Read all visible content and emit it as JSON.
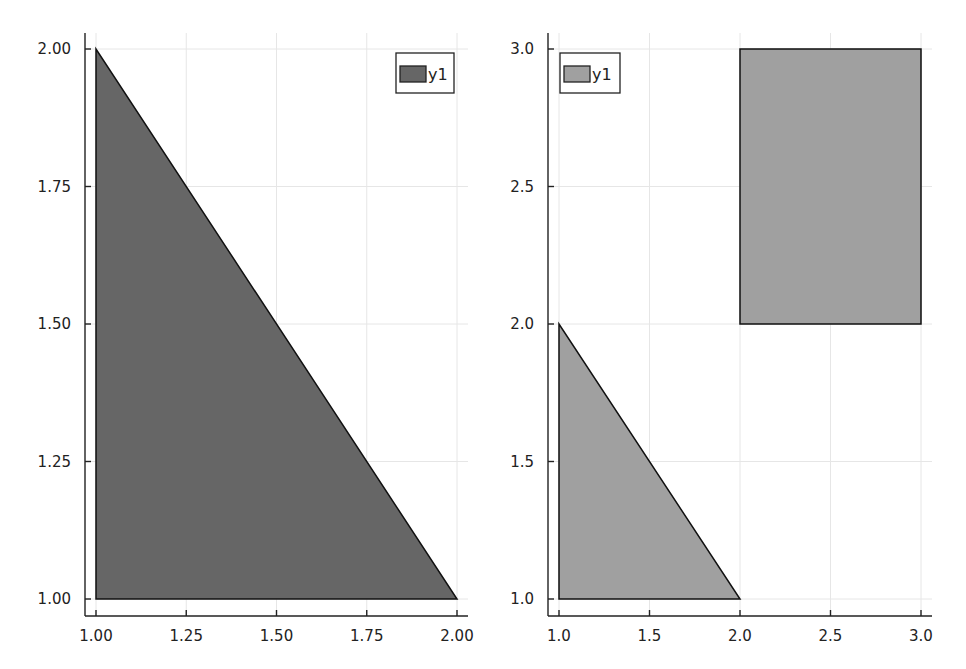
{
  "chart_data": [
    {
      "type": "area",
      "title": "",
      "xlabel": "",
      "ylabel": "",
      "xlim": [
        1.0,
        2.0
      ],
      "ylim": [
        1.0,
        2.0
      ],
      "grid": true,
      "legend_position": "top-right",
      "xticks": [
        "1.00",
        "1.25",
        "1.50",
        "1.75",
        "2.00"
      ],
      "yticks": [
        "1.00",
        "1.25",
        "1.50",
        "1.75",
        "2.00"
      ],
      "series": [
        {
          "name": "y1",
          "color": "#666666",
          "shapes": [
            {
              "kind": "polygon",
              "points": [
                [
                  1.0,
                  1.0
                ],
                [
                  2.0,
                  1.0
                ],
                [
                  1.0,
                  2.0
                ]
              ]
            }
          ]
        }
      ],
      "layout": {
        "x0": 96,
        "x1": 457,
        "y0": 599,
        "y1": 49,
        "spine_x": 85,
        "spine_y": 616,
        "spine_top": 33,
        "spine_right": 468
      }
    },
    {
      "type": "area",
      "title": "",
      "xlabel": "",
      "ylabel": "",
      "xlim": [
        1.0,
        3.0
      ],
      "ylim": [
        1.0,
        3.0
      ],
      "grid": true,
      "legend_position": "top-left",
      "xticks": [
        "1.0",
        "1.5",
        "2.0",
        "2.5",
        "3.0"
      ],
      "yticks": [
        "1.0",
        "1.5",
        "2.0",
        "2.5",
        "3.0"
      ],
      "series": [
        {
          "name": "y1",
          "color": "#a0a0a0",
          "shapes": [
            {
              "kind": "polygon",
              "points": [
                [
                  1.0,
                  1.0
                ],
                [
                  2.0,
                  1.0
                ],
                [
                  1.0,
                  2.0
                ]
              ]
            },
            {
              "kind": "polygon",
              "points": [
                [
                  2.0,
                  2.0
                ],
                [
                  3.0,
                  2.0
                ],
                [
                  3.0,
                  3.0
                ],
                [
                  2.0,
                  3.0
                ]
              ]
            }
          ]
        }
      ],
      "layout": {
        "x0": 559,
        "x1": 921,
        "y0": 599,
        "y1": 49,
        "spine_x": 548,
        "spine_y": 616,
        "spine_top": 33,
        "spine_right": 932
      }
    }
  ],
  "legends": [
    {
      "label": "y1",
      "box": [
        396,
        53,
        58,
        40
      ],
      "swatch_color": "#666666"
    },
    {
      "label": "y1",
      "box": [
        560,
        53,
        60,
        40
      ],
      "swatch_color": "#a0a0a0"
    }
  ]
}
